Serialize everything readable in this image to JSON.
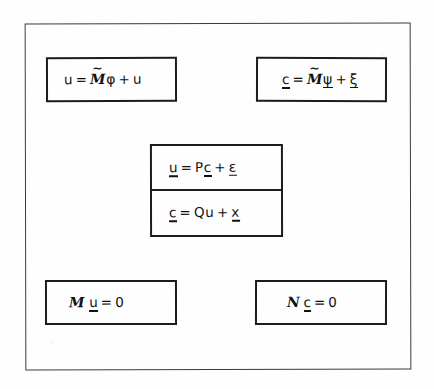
{
  "figure": {
    "type": "hand-drawn-equation-diagram",
    "background_color": "#fefefe",
    "ink_color": "#111111",
    "frame": {
      "name": "outer-border",
      "stroke": "#3b3b3b"
    }
  },
  "boxes": [
    {
      "id": "u-modal-expansion",
      "position": "top-left",
      "equation": "u = M̃ φ + u",
      "parts": {
        "lhs": "u",
        "equals": "=",
        "operator": "M",
        "operator_accent": "tilde",
        "greek": "φ",
        "plus": "+",
        "rhs": "u"
      }
    },
    {
      "id": "c-modal-expansion",
      "position": "top-right",
      "equation": "c = M̃ ψ + ξ",
      "parts": {
        "lhs": "c",
        "equals": "=",
        "operator": "M",
        "operator_accent": "tilde",
        "greek": "ψ",
        "plus": "+",
        "rhs": "ξ"
      }
    },
    {
      "id": "u-equals-Pc-plus-epsilon",
      "position": "center-top",
      "equation": "u = P c + ε",
      "parts": {
        "lhs": "u",
        "equals": "=",
        "operator": "P",
        "operand": "c",
        "plus": "+",
        "rhs": "ε"
      }
    },
    {
      "id": "c-equals-Qu-plus-x",
      "position": "center-bottom",
      "equation": "c = Q u + x",
      "parts": {
        "lhs": "c",
        "equals": "=",
        "operator": "Q",
        "operand": "u",
        "plus": "+",
        "rhs": "x"
      }
    },
    {
      "id": "M-u-equals-zero",
      "position": "bottom-left",
      "equation": "M u = 0",
      "parts": {
        "operator": "M",
        "operand": "u",
        "equals": "=",
        "rhs": "0"
      }
    },
    {
      "id": "N-c-equals-zero",
      "position": "bottom-right",
      "equation": "N c = 0",
      "parts": {
        "operator": "N",
        "operand": "c",
        "equals": "=",
        "rhs": "0"
      }
    }
  ],
  "symbols": {
    "u": "u",
    "c": "c",
    "x": "x",
    "zero": "0",
    "P": "P",
    "Q": "Qu",
    "Q_letter": "Q",
    "M": "M",
    "N": "N",
    "phi": "φ",
    "psi": "ψ",
    "xi": "ξ",
    "epsilon": "ε",
    "equals": "=",
    "plus": "+"
  }
}
